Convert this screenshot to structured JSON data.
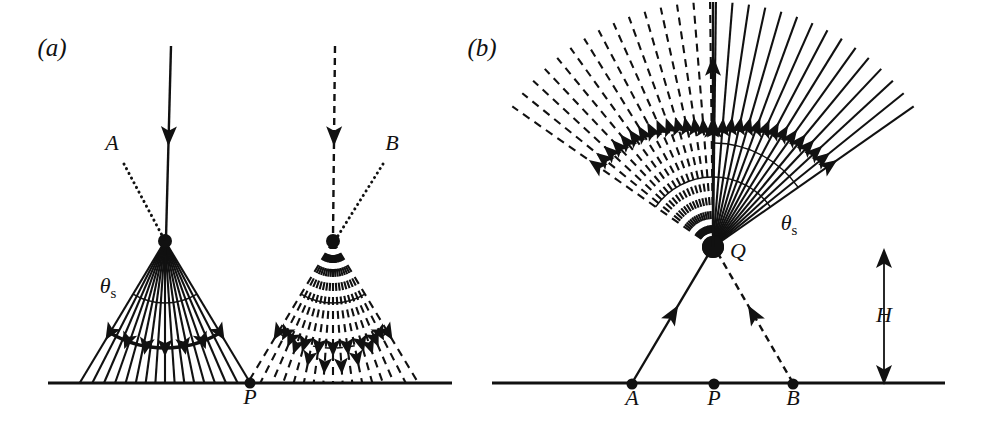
{
  "figure": {
    "type": "scientific-diagram",
    "background_color": "#ffffff",
    "ink_color": "#111111",
    "width": 1000,
    "height": 434
  },
  "panels": [
    {
      "id": "a",
      "caption": "(a)",
      "caption_pos": {
        "x": 52,
        "y": 56
      },
      "ground": {
        "x1": 48,
        "x2": 452,
        "y": 383
      },
      "points": [
        {
          "name": "P",
          "label": "P",
          "x": 250,
          "y": 383,
          "label_x": 250,
          "label_y": 404,
          "dot": true
        }
      ],
      "annotations": [
        {
          "name": "A",
          "label": "A",
          "x": 112,
          "y": 150,
          "style": "italic"
        },
        {
          "name": "B",
          "label": "B",
          "x": 392,
          "y": 150,
          "style": "italic"
        },
        {
          "name": "theta-s-left",
          "label": "θ",
          "sub": "s",
          "x": 108,
          "y": 293
        }
      ],
      "fans": [
        {
          "name": "left-fan",
          "stroke": "solid",
          "apex": {
            "x": 165,
            "y": 241
          },
          "half_angle_deg": 31,
          "axis_deg": 90,
          "ray_count": 17,
          "ray_length": 150,
          "arcs": [
            {
              "radius": 62,
              "weight": "thin",
              "arrowheads": 0
            },
            {
              "radius": 107,
              "weight": "thick",
              "arrowheads": 7
            }
          ]
        },
        {
          "name": "right-fan",
          "stroke": "dashed",
          "apex": {
            "x": 333,
            "y": 241
          },
          "half_angle_deg": 31,
          "axis_deg": 90,
          "ray_count": 17,
          "ray_length": 150,
          "arcs": [
            {
              "radius": 62,
              "weight": "thin",
              "arrowheads": 0
            },
            {
              "radius": 107,
              "weight": "dashed-arrows",
              "arrowheads": 9
            }
          ]
        }
      ],
      "incoming_rays": [
        {
          "name": "incoming-solid-ray",
          "stroke": "solid",
          "x1": 171,
          "y1": 46,
          "x2": 166,
          "y2": 238,
          "arrow_at": 0.47
        },
        {
          "name": "incoming-dashed-ray",
          "stroke": "dashed",
          "x1": 335,
          "y1": 46,
          "x2": 333,
          "y2": 238,
          "arrow_at": 0.47
        }
      ],
      "leader_lines": [
        {
          "name": "leader-a",
          "x1": 124,
          "y1": 164,
          "x2": 164,
          "y2": 239,
          "stroke": "dotted"
        },
        {
          "name": "leader-b",
          "x1": 383,
          "y1": 164,
          "x2": 336,
          "y2": 239,
          "stroke": "dotted"
        }
      ]
    },
    {
      "id": "b",
      "caption": "(b)",
      "caption_pos": {
        "x": 482,
        "y": 56
      },
      "ground": {
        "x1": 492,
        "x2": 945,
        "y": 383
      },
      "points": [
        {
          "name": "A",
          "label": "A",
          "x": 632,
          "y": 384,
          "label_x": 632,
          "label_y": 405,
          "dot": true
        },
        {
          "name": "P",
          "label": "P",
          "x": 714,
          "y": 384,
          "label_x": 714,
          "label_y": 405,
          "dot": true
        },
        {
          "name": "B",
          "label": "B",
          "x": 793,
          "y": 384,
          "label_x": 793,
          "label_y": 405,
          "dot": true
        },
        {
          "name": "Q",
          "label": "Q",
          "x": 713,
          "y": 247,
          "label_x": 738,
          "label_y": 258,
          "dot": false
        }
      ],
      "annotations": [
        {
          "name": "theta-s-right",
          "label": "θ",
          "sub": "s",
          "x": 789,
          "y": 230
        },
        {
          "name": "height-label",
          "label": "H",
          "x": 884,
          "y": 322
        }
      ],
      "fans": [
        {
          "name": "left-fan",
          "stroke": "dashed",
          "apex": {
            "x": 713,
            "y": 247
          },
          "half_angle_deg": 55,
          "axis_deg": 90,
          "side": "left",
          "ray_count": 15,
          "ray_length": 245,
          "arcs": [
            {
              "radius": 70,
              "weight": "thin",
              "arrowheads": 0
            }
          ]
        },
        {
          "name": "right-fan",
          "stroke": "solid",
          "apex": {
            "x": 713,
            "y": 247
          },
          "half_angle_deg": 55,
          "axis_deg": 90,
          "side": "right",
          "ray_count": 15,
          "ray_length": 245,
          "arcs": [
            {
              "radius": 70,
              "weight": "thin",
              "arrowheads": 0
            },
            {
              "radius": 104,
              "weight": "thin",
              "arrowheads": 0
            }
          ]
        }
      ],
      "incoming_rays": [
        {
          "name": "ray-a-to-q",
          "stroke": "solid",
          "x1": 632,
          "y1": 383,
          "x2": 711,
          "y2": 250,
          "arrow_at": 0.52
        },
        {
          "name": "ray-b-to-q",
          "stroke": "dashed",
          "x1": 793,
          "y1": 383,
          "x2": 716,
          "y2": 250,
          "arrow_at": 0.52
        },
        {
          "name": "vertical-outgoing-ray",
          "stroke": "solid",
          "x1": 713,
          "y1": 247,
          "x2": 713,
          "y2": 2,
          "arrow_at": 0.74
        }
      ],
      "height_marker": {
        "name": "height-arrow",
        "x": 884,
        "y_top": 250,
        "y_bottom": 383,
        "double_headed": true
      }
    }
  ]
}
